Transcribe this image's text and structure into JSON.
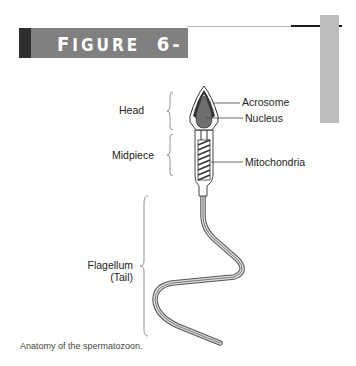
{
  "figure": {
    "label_prefix": "F",
    "label_rest": "IGURE",
    "number": "6-3",
    "accent_colors": {
      "banner": "#808080",
      "banner_dark": "#2e2e2e",
      "side_tab": "#bdbdbd"
    }
  },
  "diagram": {
    "regions": [
      {
        "label": "Head"
      },
      {
        "label": "Midpiece"
      },
      {
        "label": "Flagellum",
        "sublabel": "(Tail)"
      }
    ],
    "callouts": [
      {
        "label": "Acrosome"
      },
      {
        "label": "Nucleus"
      },
      {
        "label": "Mitochondria"
      }
    ]
  },
  "caption": "Anatomy of the spermatozoon."
}
